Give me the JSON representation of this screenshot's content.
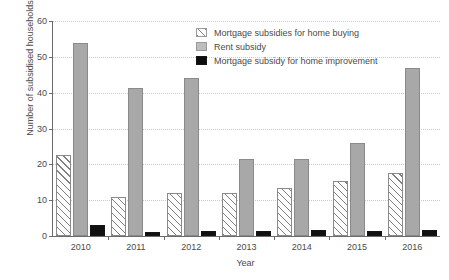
{
  "chart_data": {
    "type": "bar",
    "title": "",
    "xlabel": "Year",
    "ylabel": "Number of subsidised households (thousands)",
    "categories": [
      "2010",
      "2011",
      "2012",
      "2013",
      "2014",
      "2015",
      "2016"
    ],
    "series": [
      {
        "name": "Mortgage subsidies for home buying",
        "values": [
          22.6,
          10.9,
          12.1,
          12.1,
          13.5,
          15.3,
          17.6
        ]
      },
      {
        "name": "Rent subsidy",
        "values": [
          53.8,
          41.2,
          44.0,
          21.6,
          21.4,
          26.0,
          47.0
        ]
      },
      {
        "name": "Mortgage subsidy for home improvement",
        "values": [
          3.2,
          1.1,
          1.4,
          1.5,
          1.8,
          1.5,
          1.6
        ]
      }
    ],
    "ylim": [
      0,
      60
    ],
    "yticks": [
      0,
      10,
      20,
      30,
      40,
      50,
      60
    ],
    "ytick_labels": [
      "0",
      "10",
      "20",
      "30",
      "40",
      "50",
      "60"
    ],
    "grid": true,
    "grid_axis": "y",
    "legend_position": "top-center",
    "colors": {
      "series_0_fill": "#fdfdfd",
      "series_0_hatch": "#787878",
      "series_1_fill": "#a8a8a8",
      "series_2_fill": "#111111",
      "axis": "#6b6b6b",
      "grid": "#c9c9c9",
      "text": "#4a4a4a",
      "background": "#ffffff"
    }
  }
}
